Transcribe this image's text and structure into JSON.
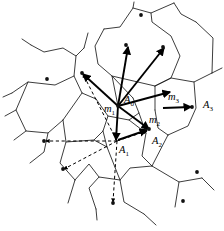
{
  "figure": {
    "kind": "voronoi-vector-diagram",
    "title": "",
    "width": 224,
    "height": 231,
    "background_color": "#ffffff",
    "line_color": "#1a1a1a",
    "vector_color": "#000000"
  },
  "labels": {
    "A0": {
      "text": "A",
      "sub": "0",
      "x": 124,
      "y": 95
    },
    "A1": {
      "text": "A",
      "sub": "1",
      "x": 119,
      "y": 145
    },
    "A2": {
      "text": "A",
      "sub": "2",
      "x": 152,
      "y": 136
    },
    "A3": {
      "text": "A",
      "sub": "3",
      "x": 203,
      "y": 100
    },
    "m1": {
      "text": "m",
      "sub": "1",
      "x": 104,
      "y": 104
    },
    "m2": {
      "text": "m",
      "sub": "2",
      "x": 149,
      "y": 115
    },
    "m3": {
      "text": "m",
      "sub": "3",
      "x": 168,
      "y": 92
    }
  },
  "sites": [
    {
      "name": "site-top-center",
      "x": 141,
      "y": 15
    },
    {
      "name": "site-upper-center",
      "x": 126,
      "y": 45
    },
    {
      "name": "site-upper-right",
      "x": 163,
      "y": 47
    },
    {
      "name": "site-left",
      "x": 47,
      "y": 79
    },
    {
      "name": "site-hub-left",
      "x": 82,
      "y": 73
    },
    {
      "name": "site-right-a3",
      "x": 192,
      "y": 107
    },
    {
      "name": "site-mid-left",
      "x": 44,
      "y": 141
    },
    {
      "name": "site-lower-left",
      "x": 63,
      "y": 169
    },
    {
      "name": "site-lower-center",
      "x": 113,
      "y": 203
    },
    {
      "name": "site-lower-right-upper",
      "x": 197,
      "y": 172
    },
    {
      "name": "site-lower-right-lower",
      "x": 183,
      "y": 201
    },
    {
      "name": "site-a2-tip",
      "x": 149,
      "y": 129
    },
    {
      "name": "site-hub-center",
      "x": 118,
      "y": 106
    }
  ],
  "vectors_solid": [
    {
      "name": "vector-A0",
      "from": [
        118,
        106
      ],
      "to": [
        170,
        92
      ]
    },
    {
      "name": "vector-up-left",
      "from": [
        118,
        106
      ],
      "to": [
        128,
        47
      ]
    },
    {
      "name": "vector-up-right",
      "from": [
        118,
        106
      ],
      "to": [
        164,
        48
      ]
    },
    {
      "name": "vector-m1-up-left",
      "from": [
        118,
        106
      ],
      "to": [
        83,
        74
      ]
    },
    {
      "name": "vector-m1-down-left",
      "from": [
        118,
        106
      ],
      "to": [
        116,
        140
      ]
    },
    {
      "name": "vector-m2-down-right",
      "from": [
        118,
        106
      ],
      "to": [
        149,
        129
      ]
    },
    {
      "name": "vector-A3",
      "from": [
        163,
        108
      ],
      "to": [
        191,
        107
      ]
    },
    {
      "name": "vector-A2",
      "from": [
        118,
        140
      ],
      "to": [
        147,
        130
      ]
    }
  ],
  "vectors_dashed": [
    {
      "name": "dashed-A1-to-left",
      "from": [
        117,
        141
      ],
      "to": [
        46,
        141
      ]
    },
    {
      "name": "dashed-A1-to-lower-left",
      "from": [
        117,
        141
      ],
      "to": [
        64,
        169
      ]
    },
    {
      "name": "dashed-A1-to-hub-left",
      "from": [
        117,
        141
      ],
      "to": [
        83,
        74
      ]
    },
    {
      "name": "dashed-A1-to-bottom",
      "from": [
        117,
        141
      ],
      "to": [
        113,
        202
      ]
    },
    {
      "name": "dashed-A1-to-A2",
      "from": [
        117,
        141
      ],
      "to": [
        147,
        131
      ]
    }
  ],
  "cells": [
    {
      "name": "edge-path-1",
      "d": "M 134 2 L 133 8 L 120 27 L 104 29"
    },
    {
      "name": "edge-path-2",
      "d": "M 133 8 L 151 13 L 174 3"
    },
    {
      "name": "edge-path-3",
      "d": "M 151 13 L 152 22 L 171 36 L 180 56 L 171 78 L 155 86"
    },
    {
      "name": "edge-path-4",
      "d": "M 174 3 L 181 14 L 196 22"
    },
    {
      "name": "edge-path-5",
      "d": "M 104 29 L 95 46 L 98 64 L 112 76"
    },
    {
      "name": "edge-path-6",
      "d": "M 31 45 L 44 52 L 63 48 L 76 56 L 84 48"
    },
    {
      "name": "edge-path-7",
      "d": "M 76 56 L 74 76 L 82 93 L 96 99"
    },
    {
      "name": "edge-path-8",
      "d": "M 74 76 L 55 85 L 28 82 L 12 93"
    },
    {
      "name": "edge-path-9",
      "d": "M 28 82 L 16 110 L 26 131 L 48 133 L 63 120"
    },
    {
      "name": "edge-path-10",
      "d": "M 63 120 L 82 93"
    },
    {
      "name": "edge-path-11",
      "d": "M 63 120 L 66 142 L 60 163 L 75 180"
    },
    {
      "name": "edge-path-12",
      "d": "M 66 142 L 94 140 L 107 147"
    },
    {
      "name": "edge-path-13",
      "d": "M 96 99 L 108 116 L 103 131 L 94 140"
    },
    {
      "name": "edge-path-14",
      "d": "M 108 116 L 129 120 L 139 113 L 133 98"
    },
    {
      "name": "edge-path-15",
      "d": "M 133 98 L 112 76 L 118 106"
    },
    {
      "name": "edge-path-16",
      "d": "M 112 76 L 155 86 L 155 110"
    },
    {
      "name": "edge-path-17",
      "d": "M 155 86 L 171 78 L 194 82 L 212 73"
    },
    {
      "name": "edge-path-18",
      "d": "M 194 82 L 196 108 L 188 126 L 168 135"
    },
    {
      "name": "edge-path-19",
      "d": "M 155 110 L 158 128 L 168 135"
    },
    {
      "name": "edge-path-20",
      "d": "M 139 113 L 146 133 L 142 156 L 152 166"
    },
    {
      "name": "edge-path-21",
      "d": "M 152 166 L 168 135"
    },
    {
      "name": "edge-path-22",
      "d": "M 152 166 L 179 182 L 202 178"
    },
    {
      "name": "edge-path-23",
      "d": "M 179 182 L 175 207"
    },
    {
      "name": "edge-path-24",
      "d": "M 152 166 L 130 168 L 120 180 L 124 202 L 144 214"
    },
    {
      "name": "edge-path-25",
      "d": "M 120 180 L 99 177 L 89 188 L 96 209"
    },
    {
      "name": "edge-path-26",
      "d": "M 99 177 L 89 164 L 75 180"
    },
    {
      "name": "edge-path-27",
      "d": "M 75 180 L 68 203"
    },
    {
      "name": "edge-path-28",
      "d": "M 107 147 L 120 180"
    },
    {
      "name": "edge-path-29",
      "d": "M 107 147 L 103 131"
    },
    {
      "name": "edge-path-30",
      "d": "M 146 133 L 129 120"
    },
    {
      "name": "edge-path-31",
      "d": "M 16 110 L 5 116"
    },
    {
      "name": "edge-path-32",
      "d": "M 48 133 L 44 152 L 30 163"
    },
    {
      "name": "edge-path-33",
      "d": "M 96 209 L 97 220"
    },
    {
      "name": "edge-path-34",
      "d": "M 144 214 L 156 225"
    },
    {
      "name": "edge-path-35",
      "d": "M 196 22 L 213 38 L 212 73"
    },
    {
      "name": "edge-path-36",
      "d": "M 212 73 L 222 68"
    },
    {
      "name": "edge-path-37",
      "d": "M 202 178 L 214 190"
    },
    {
      "name": "edge-path-38",
      "d": "M 31 45 L 22 39"
    },
    {
      "name": "edge-path-39",
      "d": "M 84 48 L 88 33"
    },
    {
      "name": "edge-path-40",
      "d": "M 12 93 L 3 97"
    },
    {
      "name": "edge-path-41",
      "d": "M 26 131 L 14 140"
    }
  ]
}
